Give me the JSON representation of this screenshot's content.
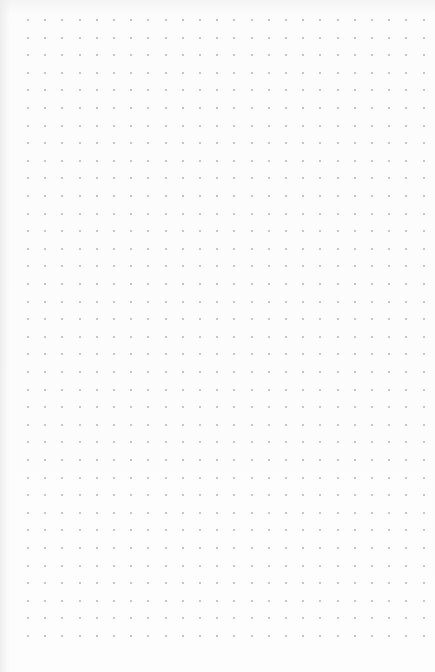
{
  "page": {
    "type": "dot-grid-paper",
    "background_color": "#fdfdfd",
    "dot_color": "#b4b4b4"
  },
  "grid": {
    "columns": 24,
    "rows": 36,
    "origin_x": 28,
    "origin_y": 20,
    "spacing_x": 17.2,
    "spacing_y": 17.6
  }
}
